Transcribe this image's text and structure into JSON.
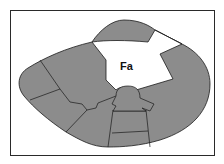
{
  "figure": {
    "type": "anatomical cross-section diagram",
    "label_region": "Fa",
    "colors": {
      "tissue_fill": "#8c8c8c",
      "highlight_fill": "#ffffff",
      "outline": "#1a1a1a",
      "frame": "#2a2a2a",
      "background": "#ffffff"
    }
  }
}
